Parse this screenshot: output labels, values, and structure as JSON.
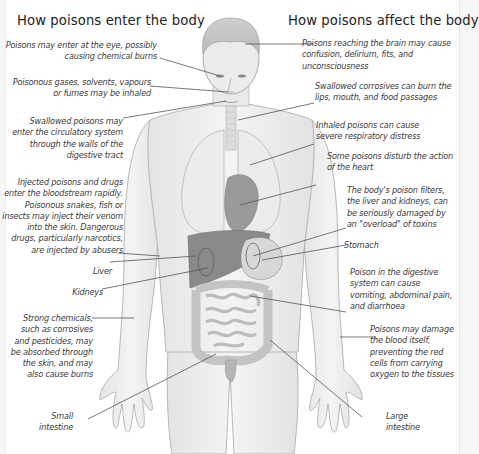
{
  "figure": {
    "partial_title_visible": true,
    "headings": {
      "left": "How poisons enter the body",
      "right": "How poisons affect the body"
    },
    "left_labels": [
      {
        "id": "eye",
        "text": "Poisons may enter at the eye, possibly causing chemical burns",
        "lines": [
          "Poisons may enter at the eye, possibly",
          "causing chemical burns"
        ]
      },
      {
        "id": "inhaled",
        "text": "Poisonous gases, solvents, vapours or fumes may be inhaled",
        "lines": [
          "Poisonous gases, solvents, vapours",
          "or fumes may be inhaled"
        ]
      },
      {
        "id": "swallowed",
        "text": "Swallowed poisons may enter the circulatory system through the walls of the digestive tract",
        "lines": [
          "Swallowed poisons may",
          "enter the circulatory system",
          "through the walls of the",
          "digestive tract"
        ]
      },
      {
        "id": "injected",
        "text": "Injected poisons and drugs enter the bloodstream rapidly. Poisonous snakes, fish or insects may inject their venom into the skin. Dangerous drugs, particularly narcotics, are injected by abusers",
        "lines": [
          "Injected poisons and drugs",
          "enter the bloodstream rapidly.",
          "Poisonous snakes, fish or",
          "insects may inject their venom",
          "into the skin. Dangerous",
          "drugs, particularly narcotics,",
          "are injected by abusers"
        ]
      },
      {
        "id": "liver",
        "text": "Liver",
        "lines": [
          "Liver"
        ]
      },
      {
        "id": "kidneys",
        "text": "Kidneys",
        "lines": [
          "Kidneys"
        ]
      },
      {
        "id": "skin",
        "text": "Strong chemicals, such as corrosives and pesticides, may be absorbed through the skin, and may also cause burns",
        "lines": [
          "Strong chemicals,",
          "such as corrosives",
          "and pesticides, may",
          "be absorbed through",
          "the skin, and may",
          "also cause burns"
        ]
      },
      {
        "id": "small_intestine",
        "text": "Small intestine",
        "lines": [
          "Small",
          "intestine"
        ]
      }
    ],
    "right_labels": [
      {
        "id": "brain",
        "text": "Poisons reaching the brain may cause confusion, delirium, fits, and unconsciousness",
        "lines": [
          "Poisons reaching the brain may cause",
          "confusion, delirium, fits, and",
          "unconsciousness"
        ]
      },
      {
        "id": "corrosives",
        "text": "Swallowed corrosives can burn the lips, mouth, and food passages",
        "lines": [
          "Swallowed corrosives can burn the",
          "lips, mouth, and food passages"
        ]
      },
      {
        "id": "respiratory",
        "text": "Inhaled poisons can cause severe respiratory distress",
        "lines": [
          "Inhaled poisons can cause",
          "severe respiratory distress"
        ]
      },
      {
        "id": "heart",
        "text": "Some poisons disturb the action of the heart",
        "lines": [
          "Some poisons disturb the action",
          "of the heart"
        ]
      },
      {
        "id": "filters",
        "text": "The body's poison filters, the liver and kidneys, can be seriously damaged by an \"overload\" of toxins",
        "lines": [
          "The body's poison filters,",
          "the liver and kidneys, can",
          "be seriously damaged by",
          "an \"overload\" of toxins"
        ]
      },
      {
        "id": "stomach",
        "text": "Stomach",
        "lines": [
          "Stomach"
        ]
      },
      {
        "id": "digestive",
        "text": "Poison in the digestive system can cause vomiting, abdominal pain, and diarrhoea",
        "lines": [
          "Poison in the digestive",
          "system can cause",
          "vomiting, abdominal pain,",
          "and diarrhoea"
        ]
      },
      {
        "id": "blood",
        "text": "Poisons may damage the blood itself, preventing the red cells from carrying oxygen to the tissues",
        "lines": [
          "Poisons may damage",
          "the blood itself,",
          "preventing the red",
          "cells from carrying",
          "oxygen to the tissues"
        ]
      },
      {
        "id": "large_intestine",
        "text": "Large intestine",
        "lines": [
          "Large",
          "intestine"
        ]
      }
    ],
    "colors": {
      "background": "#ffffff",
      "outer": "#f6f6f6",
      "skin": "#efefef",
      "outline": "#9a9a9a",
      "organ_dark": "#8a8a8a",
      "organ_mid": "#b8b8b8",
      "lung": "#e6e6e6",
      "leader_line": "#555555",
      "text": "#3a3a3a"
    }
  }
}
